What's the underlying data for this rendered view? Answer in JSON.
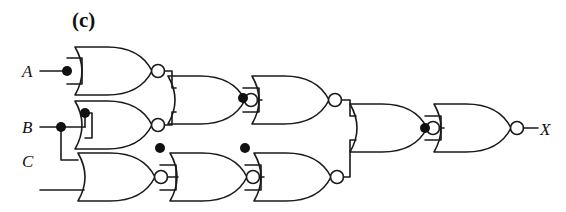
{
  "figure": {
    "panel_label": "(c)",
    "type": "logic-circuit-schematic",
    "gate_family": "NOR",
    "stroke_color": "#1a1a1a",
    "background_color": "#ffffff"
  },
  "inputs": [
    {
      "id": "A",
      "label": "A"
    },
    {
      "id": "B",
      "label": "B"
    },
    {
      "id": "C",
      "label": "C"
    }
  ],
  "outputs": [
    {
      "id": "X",
      "label": "X"
    }
  ],
  "gates": [
    {
      "id": "g1",
      "name": "nor-gate-1",
      "column": 1,
      "row": "top",
      "tied_inputs": true,
      "inputs": [
        "A"
      ],
      "output": "n1"
    },
    {
      "id": "g2",
      "name": "nor-gate-2",
      "column": 1,
      "row": "middle",
      "tied_inputs": true,
      "inputs": [
        "B"
      ],
      "output": "n2"
    },
    {
      "id": "g3",
      "name": "nor-gate-3",
      "column": 1,
      "row": "bottom",
      "tied_inputs": false,
      "inputs": [
        "B",
        "C"
      ],
      "output": "n3"
    },
    {
      "id": "g4",
      "name": "nor-gate-4",
      "column": 2,
      "row": "top",
      "tied_inputs": false,
      "inputs": [
        "n1",
        "n2"
      ],
      "output": "n4"
    },
    {
      "id": "g5",
      "name": "nor-gate-5",
      "column": 2,
      "row": "bottom",
      "tied_inputs": true,
      "inputs": [
        "n3"
      ],
      "output": "n5"
    },
    {
      "id": "g6",
      "name": "nor-gate-6",
      "column": 3,
      "row": "top",
      "tied_inputs": true,
      "inputs": [
        "n4"
      ],
      "output": "n6"
    },
    {
      "id": "g7",
      "name": "nor-gate-7",
      "column": 3,
      "row": "bottom",
      "tied_inputs": true,
      "inputs": [
        "n5"
      ],
      "output": "n7"
    },
    {
      "id": "g8",
      "name": "nor-gate-8",
      "column": 4,
      "row": "center",
      "tied_inputs": false,
      "inputs": [
        "n6",
        "n7"
      ],
      "output": "n8"
    },
    {
      "id": "g9",
      "name": "nor-gate-9",
      "column": 5,
      "row": "center",
      "tied_inputs": true,
      "inputs": [
        "n8"
      ],
      "output": "X"
    }
  ],
  "junction_dots": [
    {
      "name": "junction-a-tie",
      "x": 67,
      "y": 71
    },
    {
      "name": "junction-b-fan",
      "x": 61,
      "y": 127
    },
    {
      "name": "junction-b-tie",
      "x": 85,
      "y": 113
    },
    {
      "name": "junction-n3-tie",
      "x": 160,
      "y": 148
    },
    {
      "name": "junction-n4-tie",
      "x": 243,
      "y": 98
    },
    {
      "name": "junction-n5-tie",
      "x": 245,
      "y": 148
    },
    {
      "name": "junction-n8-tie",
      "x": 425,
      "y": 128
    }
  ]
}
